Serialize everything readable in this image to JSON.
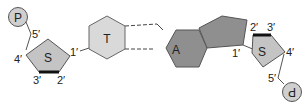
{
  "diagram": {
    "title": "",
    "left_nucleotide": {
      "phosphate": "P",
      "sugar": "S",
      "base": "T",
      "carbons": {
        "c1": "1′",
        "c2": "2′",
        "c3": "3′",
        "c4": "4′",
        "c5": "5′"
      }
    },
    "right_nucleotide": {
      "phosphate": "P",
      "sugar": "S",
      "base": "A",
      "carbons": {
        "c1": "1′",
        "c2": "2′",
        "c3": "3′",
        "c4": "4′",
        "c5": "5′"
      }
    },
    "hydrogen_bonds": 2,
    "colors": {
      "sugar_fill": "#c4c4c4",
      "thymine_fill": "#d9d9d9",
      "adenine_fill": "#8f8f8f",
      "phosphate_fill": "#cfcfcf",
      "stroke": "#555555"
    }
  }
}
